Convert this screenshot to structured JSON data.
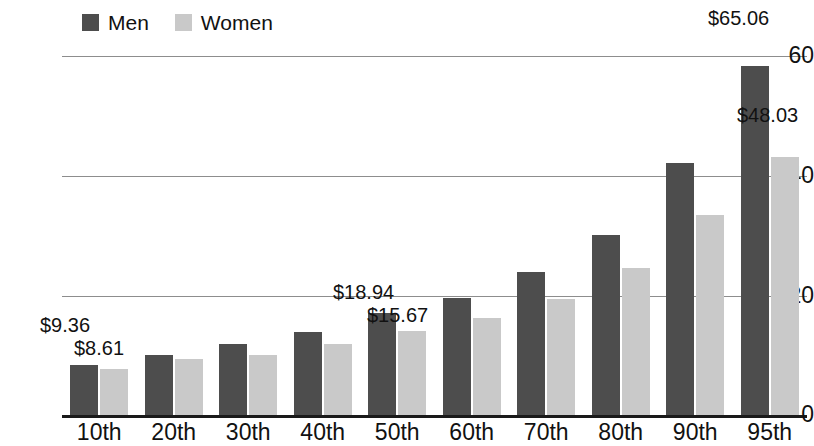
{
  "chart_data": {
    "type": "bar",
    "title": "",
    "xlabel": "",
    "ylabel": "",
    "ylim": [
      0,
      68
    ],
    "yticks": [
      0,
      20,
      40,
      60
    ],
    "ytick_labels": [
      "0",
      "20",
      "40",
      "60"
    ],
    "grid": true,
    "legend_position": "top-left",
    "categories": [
      "10th",
      "20th",
      "30th",
      "40th",
      "50th",
      "60th",
      "70th",
      "80th",
      "90th",
      "95th"
    ],
    "series": [
      {
        "name": "Men",
        "color": "#4d4d4d",
        "values": [
          9.36,
          11.2,
          13.3,
          15.5,
          18.94,
          21.8,
          26.6,
          33.5,
          47.0,
          65.06
        ]
      },
      {
        "name": "Women",
        "color": "#c9c9c9",
        "values": [
          8.61,
          10.5,
          11.2,
          13.2,
          15.67,
          18.0,
          21.7,
          27.3,
          37.2,
          48.03
        ]
      }
    ],
    "annotations": [
      {
        "text": "$9.36",
        "category": "10th",
        "series": "Men"
      },
      {
        "text": "$8.61",
        "category": "10th",
        "series": "Women"
      },
      {
        "text": "$18.94",
        "category": "50th",
        "series": "Men"
      },
      {
        "text": "$15.67",
        "category": "50th",
        "series": "Women"
      },
      {
        "text": "$65.06",
        "category": "95th",
        "series": "Men"
      },
      {
        "text": "$48.03",
        "category": "95th",
        "series": "Women"
      }
    ]
  },
  "legend": {
    "men": {
      "label": "Men",
      "color": "#4d4d4d"
    },
    "women": {
      "label": "Women",
      "color": "#c9c9c9"
    }
  },
  "axis": {
    "y": {
      "t0": "0",
      "t20": "20",
      "t40": "40",
      "t60": "60"
    },
    "x": {
      "c0": "10th",
      "c1": "20th",
      "c2": "30th",
      "c3": "40th",
      "c4": "50th",
      "c5": "60th",
      "c6": "70th",
      "c7": "80th",
      "c8": "90th",
      "c9": "95th"
    }
  },
  "labels": {
    "men_10th": "$9.36",
    "women_10th": "$8.61",
    "men_50th": "$18.94",
    "women_50th": "$15.67",
    "men_95th": "$65.06",
    "women_95th": "$48.03"
  }
}
